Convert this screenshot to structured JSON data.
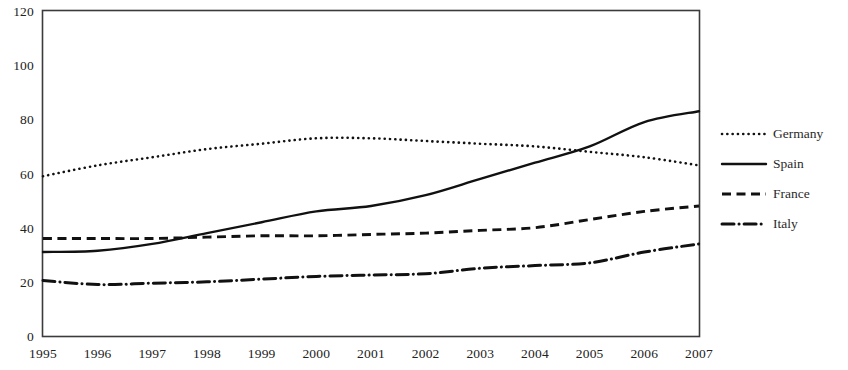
{
  "chart_data": {
    "type": "line",
    "title": "",
    "subtitle": "",
    "xlabel": "",
    "ylabel": "",
    "x": [
      1995,
      1996,
      1997,
      1998,
      1999,
      2000,
      2001,
      2002,
      2003,
      2004,
      2005,
      2006,
      2007
    ],
    "categories": [
      "1995",
      "1996",
      "1997",
      "1998",
      "1999",
      "2000",
      "2001",
      "2002",
      "2003",
      "2004",
      "2005",
      "2006",
      "2007"
    ],
    "xlim": [
      1995,
      2007
    ],
    "ylim": [
      0,
      120
    ],
    "yticks": [
      0,
      20,
      40,
      60,
      80,
      100,
      120
    ],
    "ytick_labels": [
      "0",
      "20",
      "40",
      "60",
      "80",
      "100",
      "120"
    ],
    "grid": false,
    "legend_position": "right",
    "series": [
      {
        "name": "Germany",
        "style": "dotted",
        "color": "#111111",
        "values": [
          59,
          63,
          66,
          69,
          71,
          73,
          73,
          72,
          71,
          70,
          68,
          66,
          63
        ]
      },
      {
        "name": "Spain",
        "style": "solid",
        "color": "#111111",
        "values": [
          31,
          31.5,
          34,
          38,
          42,
          46,
          48,
          52,
          58,
          64,
          70,
          79,
          83
        ]
      },
      {
        "name": "France",
        "style": "dashed",
        "color": "#111111",
        "values": [
          36,
          36,
          36,
          36.5,
          37,
          37,
          37.5,
          38,
          39,
          40,
          43,
          46,
          48
        ]
      },
      {
        "name": "Italy",
        "style": "dash-dot",
        "color": "#111111",
        "values": [
          20.5,
          19,
          19.5,
          20,
          21,
          22,
          22.5,
          23,
          25,
          26,
          27,
          31,
          34
        ]
      }
    ]
  },
  "legend": {
    "entries": [
      {
        "label": "Germany",
        "style": "dotted"
      },
      {
        "label": "Spain",
        "style": "solid"
      },
      {
        "label": "France",
        "style": "dashed"
      },
      {
        "label": "Italy",
        "style": "dash-dot"
      }
    ]
  }
}
